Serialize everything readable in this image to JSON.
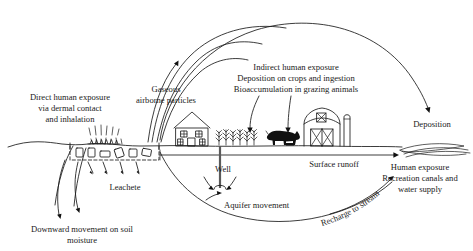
{
  "figure": {
    "type": "conceptual-pathway-diagram",
    "background_color": "#ffffff",
    "line_color": "#1a1a1a"
  },
  "labels": {
    "direct_exposure": {
      "line1": "Direct human exposure",
      "line2": "via dermal contact",
      "line3": "and inhalation"
    },
    "gaseous": {
      "line1": "Gaseous",
      "line2": "airborne particles"
    },
    "indirect_exposure": {
      "line1": "Indirect human exposure",
      "line2": "Deposition on crops and ingestion",
      "line3": "Bioaccumulation in grazing animals"
    },
    "deposition": "Deposition",
    "leachete": "Leachete",
    "downward": {
      "line1": "Downward movement on soil",
      "line2": "moisture"
    },
    "well": "Well",
    "aquifer": "Aquifer movement",
    "surface_runoff": "Surface runoff",
    "recharge": "Recharge to stream",
    "human_exposure_water": {
      "line1": "Human exposure",
      "line2": "Recreation canals and",
      "line3": "water supply"
    }
  },
  "elements": {
    "landfill": "dashed-cell-landfill",
    "house": "farm-house",
    "crops": "crop-field",
    "cow": "grazing-cow",
    "barn": "barn-building",
    "silo": "silo",
    "stream": "stream-water-body",
    "vapor": "vapor-emission-marks",
    "people": "people-at-landfill"
  }
}
